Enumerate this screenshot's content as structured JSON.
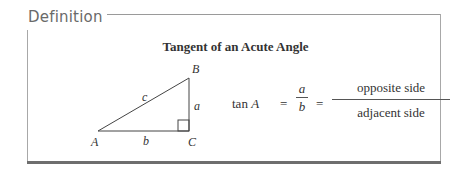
{
  "section_label": "Definition",
  "title": "Tangent of an Acute Angle",
  "triangle": {
    "vertices": {
      "A": "A",
      "B": "B",
      "C": "C"
    },
    "sides": {
      "a": "a",
      "b": "b",
      "c": "c"
    },
    "right_angle_at": "C"
  },
  "formula": {
    "lhs_func": "tan",
    "lhs_var": "A",
    "equals": "=",
    "ratio_numerator": "a",
    "ratio_denominator": "b",
    "words_numerator": "opposite side",
    "words_denominator": "adjacent side"
  }
}
